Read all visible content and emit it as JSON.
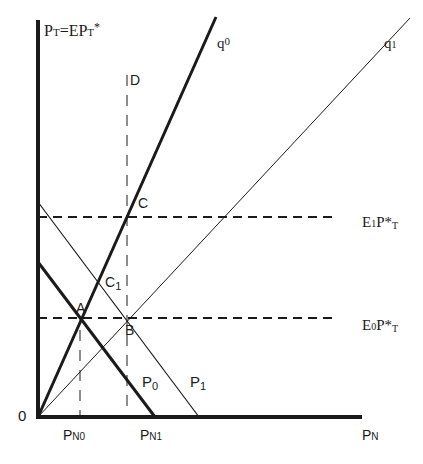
{
  "diagram": {
    "type": "economic-diagram",
    "axes": {
      "y_label": {
        "main": "P",
        "sub1": "T",
        "mid": "=EP",
        "sub2": "T",
        "sup": "*"
      },
      "x_label": {
        "main": "P",
        "sub": "N"
      },
      "origin_label": "0"
    },
    "curves": {
      "q0": {
        "main": "q",
        "sub": "0"
      },
      "q1": {
        "main": "q",
        "sub": "1"
      },
      "p0": {
        "main": "P",
        "sub": "0"
      },
      "p1": {
        "main": "P",
        "sub": "1"
      }
    },
    "levels": {
      "e1": {
        "main": "E",
        "sub": "1",
        "rest": "P*",
        "sub2": "T"
      },
      "e0": {
        "main": "E",
        "sub": "0",
        "rest": "P*",
        "sub2": "T"
      }
    },
    "points": {
      "A": "A",
      "B": "B",
      "C": "C",
      "C1": {
        "main": "C",
        "sub": "1"
      },
      "D": "D"
    },
    "x_ticks": {
      "pn0": {
        "main": "P",
        "sub": "N0"
      },
      "pn1": {
        "main": "P",
        "sub": "N1"
      }
    },
    "colors": {
      "line": "#1a1a1a",
      "background": "#ffffff"
    }
  }
}
